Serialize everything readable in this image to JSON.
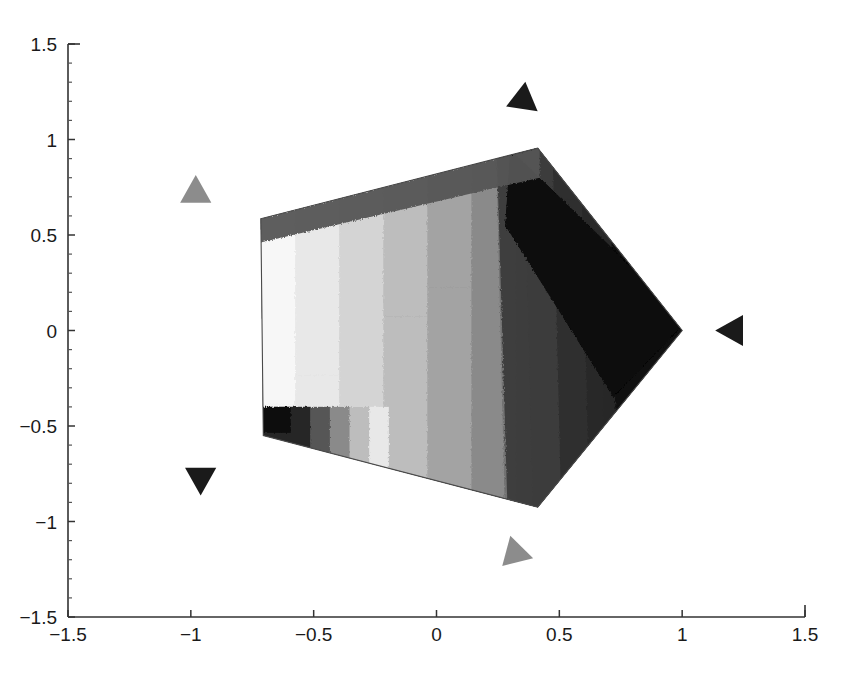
{
  "figure": {
    "title": "",
    "background_color": "#ffffff",
    "width": 851,
    "height": 683
  },
  "chart_data": {
    "type": "heatmap",
    "title": "",
    "subtitle": "",
    "xlabel": "",
    "ylabel": "",
    "xlim": [
      -1.5,
      1.5
    ],
    "ylim": [
      -1.5,
      1.5
    ],
    "grid": false,
    "legend": "none",
    "colormap": "gray",
    "x_ticks": [
      -1.5,
      -1,
      -0.5,
      0,
      0.5,
      1,
      1.5
    ],
    "x_tick_labels": [
      "-1.5",
      "-1",
      "-0.5",
      "0",
      "0.5",
      "1",
      "1.5"
    ],
    "y_ticks": [
      -1.5,
      -1,
      -0.5,
      0,
      0.5,
      1,
      1.5
    ],
    "y_tick_labels": [
      "-1.5",
      "-1",
      "-0.5",
      "0",
      "0.5",
      "1",
      "1.5"
    ],
    "x_minor_tick_count": 4,
    "y_minor_tick_count": 4,
    "domain_polygon": {
      "name": "pentagon",
      "vertices": [
        {
          "x": -0.715,
          "y": 0.585
        },
        {
          "x": 0.412,
          "y": 0.955
        },
        {
          "x": 1.0,
          "y": 0.0
        },
        {
          "x": 0.412,
          "y": -0.925
        },
        {
          "x": -0.705,
          "y": -0.55
        }
      ]
    },
    "markers": [
      {
        "name": "marker-top-left",
        "x": -0.98,
        "y": 0.73,
        "color": "#8c8c8c",
        "rotation_deg": 0,
        "shape": "triangle"
      },
      {
        "name": "marker-top",
        "x": 0.36,
        "y": 1.2,
        "color": "#1a1a1a",
        "rotation_deg": 128,
        "shape": "triangle"
      },
      {
        "name": "marker-right",
        "x": 1.2,
        "y": 0.0,
        "color": "#1a1a1a",
        "rotation_deg": 270,
        "shape": "triangle"
      },
      {
        "name": "marker-bottom",
        "x": 0.33,
        "y": -1.17,
        "color": "#8c8c8c",
        "rotation_deg": 105,
        "shape": "triangle"
      },
      {
        "name": "marker-bottom-left",
        "x": -0.96,
        "y": -0.78,
        "color": "#1a1a1a",
        "rotation_deg": 180,
        "shape": "triangle"
      }
    ],
    "shading_bands": [
      {
        "level": 1,
        "gray": "#0d0d0d",
        "label": "darkest-corner"
      },
      {
        "level": 2,
        "gray": "#262626",
        "label": "very-dark"
      },
      {
        "level": 3,
        "gray": "#3d3d3d",
        "label": "dark"
      },
      {
        "level": 4,
        "gray": "#565656",
        "label": "dark-mid"
      },
      {
        "level": 5,
        "gray": "#6e6e6e",
        "label": "mid"
      },
      {
        "level": 6,
        "gray": "#8a8a8a",
        "label": "mid-light"
      },
      {
        "level": 7,
        "gray": "#a3a3a3",
        "label": "light-mid"
      },
      {
        "level": 8,
        "gray": "#bdbdbd",
        "label": "light"
      },
      {
        "level": 9,
        "gray": "#d4d4d4",
        "label": "lighter"
      },
      {
        "level": 10,
        "gray": "#e8e8e8",
        "label": "near-white"
      },
      {
        "level": 11,
        "gray": "#f7f7f7",
        "label": "brightest"
      }
    ]
  },
  "axes": {
    "frame_color": "#333333",
    "tick_color": "#333333",
    "label_color": "#1a1a1a"
  }
}
